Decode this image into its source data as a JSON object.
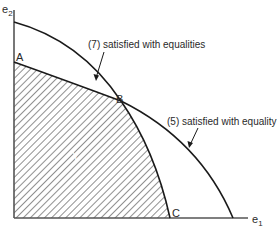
{
  "figure": {
    "axes": {
      "x_label": "e",
      "x_sub": "1",
      "y_label": "e",
      "y_sub": "2"
    },
    "points": {
      "A": "A",
      "B": "B",
      "C": "C"
    },
    "region_label": "Y",
    "annotations": {
      "outer_curve": "(7) satisfied with equalities",
      "middle_curve": "(5) satisfied with equality"
    },
    "colors": {
      "ink": "#1a1a1a",
      "axis": "#555555",
      "hatch": "#333333",
      "background": "#ffffff"
    }
  }
}
